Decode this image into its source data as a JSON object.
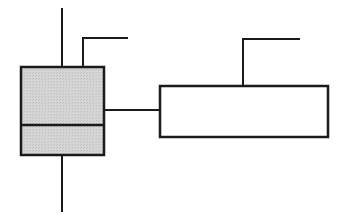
{
  "diagram": {
    "canvas": {
      "width": 350,
      "height": 224,
      "background": "#ffffff"
    },
    "colors": {
      "stroke": "#1a1a1a",
      "shaded_fill": "#d4d4d4",
      "plain_fill": "#ffffff"
    },
    "components": {
      "shaded_block": {
        "x": 21,
        "y": 67,
        "width": 83,
        "height": 88,
        "divider_y": 125
      },
      "plain_block": {
        "x": 160,
        "y": 86,
        "width": 168,
        "height": 51
      }
    },
    "lines": {
      "top_lead": {
        "x1": 62,
        "y1": 8,
        "x2": 62,
        "y2": 67
      },
      "bottom_lead": {
        "x1": 62,
        "y1": 155,
        "x2": 62,
        "y2": 212
      },
      "connector": {
        "x1": 104,
        "y1": 110,
        "x2": 160,
        "y2": 110
      },
      "left_tab": {
        "points": "83,67 83,38 128,38"
      },
      "right_tab": {
        "points": "243,86 243,39 300,39"
      }
    }
  }
}
